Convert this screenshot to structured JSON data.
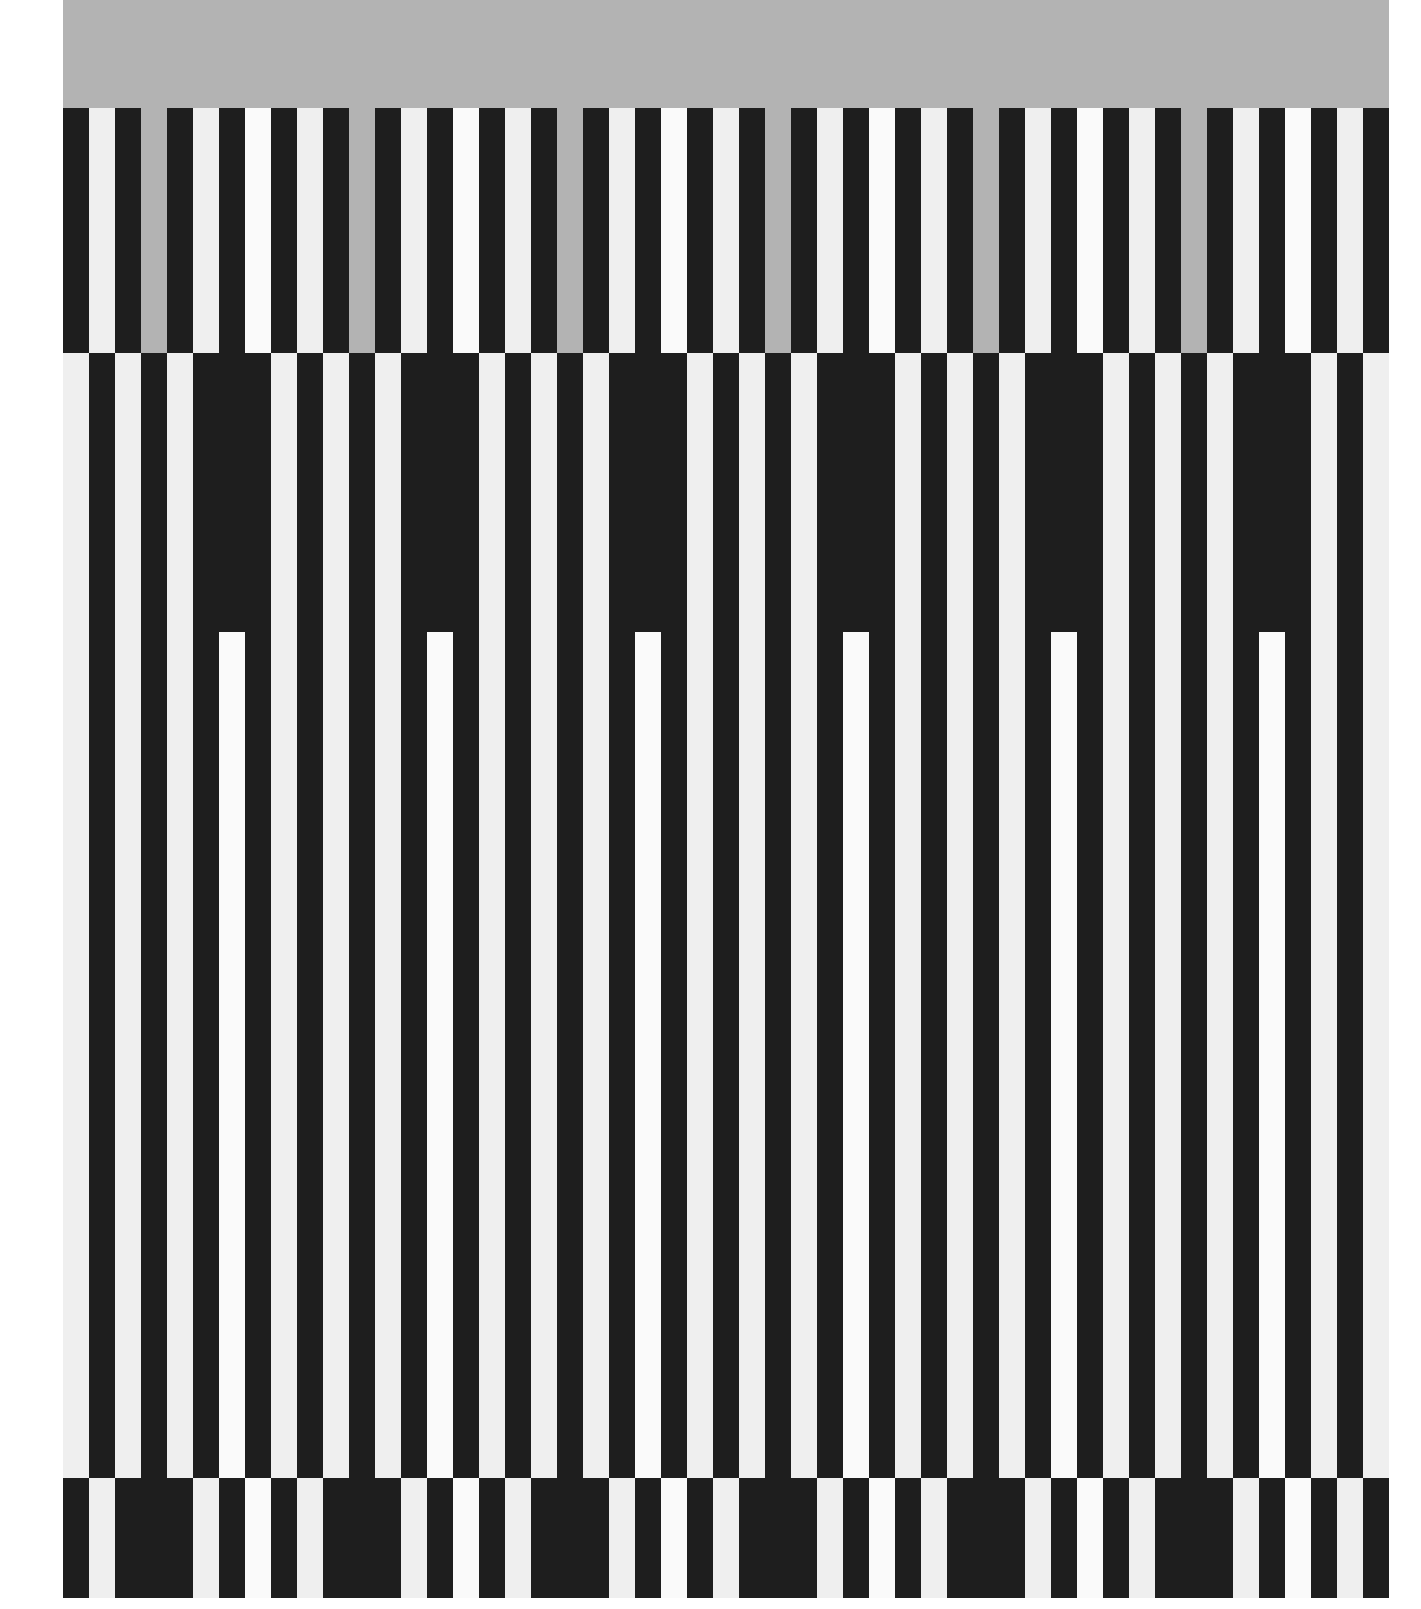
{
  "artwork": {
    "colors": {
      "dark": "#1e1e1e",
      "light": "#efefef",
      "white": "#fafafa",
      "gray": "#b3b3b3",
      "paper": "#ffffff"
    },
    "canvas": {
      "left": 63,
      "right": 1390,
      "column_width": 26,
      "columns": 51
    },
    "bands": [
      {
        "name": "top-gray-field",
        "top": 0,
        "height": 108,
        "pattern": [
          "G"
        ]
      },
      {
        "name": "top-stripe-band",
        "top": 108,
        "height": 245,
        "pattern": [
          "D",
          "L",
          "D",
          "G",
          "D",
          "L",
          "D",
          "W"
        ]
      },
      {
        "name": "middle-stripe-band",
        "top": 353,
        "height": 1125,
        "pattern": [
          "L",
          "D",
          "L",
          "D",
          "L",
          "D",
          "N",
          "D"
        ],
        "notch_top": 632
      },
      {
        "name": "bottom-stripe-band",
        "top": 1478,
        "height": 120,
        "pattern": [
          "D",
          "L",
          "D",
          "D",
          "D",
          "L",
          "D",
          "W"
        ]
      }
    ]
  }
}
